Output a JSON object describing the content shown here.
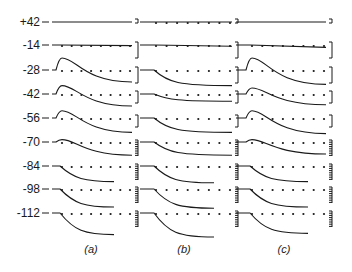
{
  "chart_data": {
    "type": "line",
    "title": "",
    "xlabel": "",
    "ylabel": "",
    "row_labels": [
      "+42",
      "-14",
      "-28",
      "-42",
      "-56",
      "-70",
      "-84",
      "-98",
      "-112"
    ],
    "panels": [
      {
        "caption": "(a)",
        "rows": [
          {
            "potential": "+42",
            "shape": "flat",
            "peak": 0.0,
            "steady": 0.0,
            "dotted_baseline": false,
            "scale": "bracket"
          },
          {
            "potential": "-14",
            "shape": "flat",
            "peak": 0.1,
            "steady": -0.05,
            "dotted_baseline": true,
            "scale": "bracket"
          },
          {
            "potential": "-28",
            "shape": "peak-then-decay",
            "peak": 1.0,
            "steady": -1.0,
            "dotted_baseline": true,
            "scale": "bracket"
          },
          {
            "potential": "-42",
            "shape": "peak-then-decay",
            "peak": 0.7,
            "steady": -1.0,
            "dotted_baseline": true,
            "scale": "bracket"
          },
          {
            "potential": "-56",
            "shape": "peak-then-decay",
            "peak": 0.6,
            "steady": -1.2,
            "dotted_baseline": true,
            "scale": "bracket"
          },
          {
            "potential": "-70",
            "shape": "peak-then-decay",
            "peak": 0.2,
            "steady": -1.1,
            "dotted_baseline": true,
            "scale": "comb"
          },
          {
            "potential": "-84",
            "shape": "decay",
            "peak": 0.1,
            "steady": -1.3,
            "dotted_baseline": true,
            "scale": "comb"
          },
          {
            "potential": "-98",
            "shape": "decay",
            "peak": 0.0,
            "steady": -1.5,
            "dotted_baseline": true,
            "scale": "comb"
          },
          {
            "potential": "-112",
            "shape": "decay",
            "peak": 0.0,
            "steady": -1.8,
            "dotted_baseline": true,
            "scale": "comb"
          }
        ]
      },
      {
        "caption": "(b)",
        "rows": [
          {
            "potential": "+42",
            "shape": "flat",
            "peak": 0.0,
            "steady": 0.0,
            "dotted_baseline": true,
            "scale": "bracket"
          },
          {
            "potential": "-14",
            "shape": "flat",
            "peak": 0.0,
            "steady": -0.1,
            "dotted_baseline": true,
            "scale": "bracket"
          },
          {
            "potential": "-28",
            "shape": "decay",
            "peak": 0.0,
            "steady": -1.3,
            "dotted_baseline": true,
            "scale": "bracket"
          },
          {
            "potential": "-42",
            "shape": "decay",
            "peak": 0.0,
            "steady": -0.6,
            "dotted_baseline": true,
            "scale": "bracket"
          },
          {
            "potential": "-56",
            "shape": "decay",
            "peak": 0.0,
            "steady": -1.2,
            "dotted_baseline": true,
            "scale": "bracket"
          },
          {
            "potential": "-70",
            "shape": "decay",
            "peak": 0.0,
            "steady": -1.1,
            "dotted_baseline": true,
            "scale": "comb"
          },
          {
            "potential": "-84",
            "shape": "decay",
            "peak": 0.0,
            "steady": -1.4,
            "dotted_baseline": true,
            "scale": "comb"
          },
          {
            "potential": "-98",
            "shape": "decay",
            "peak": 0.0,
            "steady": -1.6,
            "dotted_baseline": true,
            "scale": "comb"
          },
          {
            "potential": "-112",
            "shape": "decay",
            "peak": 0.0,
            "steady": -2.0,
            "dotted_baseline": true,
            "scale": "comb"
          }
        ]
      },
      {
        "caption": "(c)",
        "rows": [
          {
            "potential": "+42",
            "shape": "flat",
            "peak": 0.0,
            "steady": 0.0,
            "dotted_baseline": false,
            "scale": "bracket"
          },
          {
            "potential": "-14",
            "shape": "flat",
            "peak": 0.1,
            "steady": -0.2,
            "dotted_baseline": true,
            "scale": "bracket"
          },
          {
            "potential": "-28",
            "shape": "peak-then-decay",
            "peak": 1.0,
            "steady": -1.2,
            "dotted_baseline": true,
            "scale": "bracket"
          },
          {
            "potential": "-42",
            "shape": "peak-then-decay",
            "peak": 0.5,
            "steady": -0.9,
            "dotted_baseline": true,
            "scale": "bracket"
          },
          {
            "potential": "-56",
            "shape": "peak-then-decay",
            "peak": 0.6,
            "steady": -1.3,
            "dotted_baseline": true,
            "scale": "bracket"
          },
          {
            "potential": "-70",
            "shape": "peak-then-decay",
            "peak": 0.2,
            "steady": -1.0,
            "dotted_baseline": true,
            "scale": "comb"
          },
          {
            "potential": "-84",
            "shape": "decay",
            "peak": 0.0,
            "steady": -1.3,
            "dotted_baseline": true,
            "scale": "comb"
          },
          {
            "potential": "-98",
            "shape": "decay",
            "peak": 0.0,
            "steady": -1.5,
            "dotted_baseline": true,
            "scale": "comb"
          },
          {
            "potential": "-112",
            "shape": "decay",
            "peak": 0.0,
            "steady": -1.7,
            "dotted_baseline": true,
            "scale": "comb"
          }
        ]
      }
    ]
  }
}
